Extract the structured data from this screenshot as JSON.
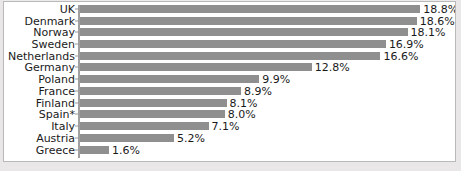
{
  "chart_data": {
    "type": "bar",
    "orientation": "horizontal",
    "title": "",
    "subtitle": "",
    "xlabel": "",
    "ylabel": "",
    "grid": false,
    "legend": false,
    "xlim": [
      0,
      18.8
    ],
    "categories": [
      "UK",
      "Denmark",
      "Norway",
      "Sweden",
      "Netherlands",
      "Germany",
      "Poland",
      "France",
      "Finland",
      "Spain*",
      "Italy",
      "Austria",
      "Greece"
    ],
    "values": [
      18.8,
      18.6,
      18.1,
      16.9,
      16.6,
      12.8,
      9.9,
      8.9,
      8.1,
      8.0,
      7.1,
      5.2,
      1.6
    ],
    "value_labels": [
      "18.8%",
      "18.6%",
      "18.1%",
      "16.9%",
      "16.6%",
      "12.8%",
      "9.9%",
      "8.9%",
      "8.1%",
      "8.0%",
      "7.1%",
      "5.2%",
      "1.6%"
    ]
  },
  "style": {
    "bar_color": "#8f8f8f",
    "panel_background": "#ffffff",
    "page_background": "#eceaea",
    "panel_border": "#b9b9b9",
    "axis_color": "#a0a0a0",
    "text_color": "#1a1a1a"
  }
}
